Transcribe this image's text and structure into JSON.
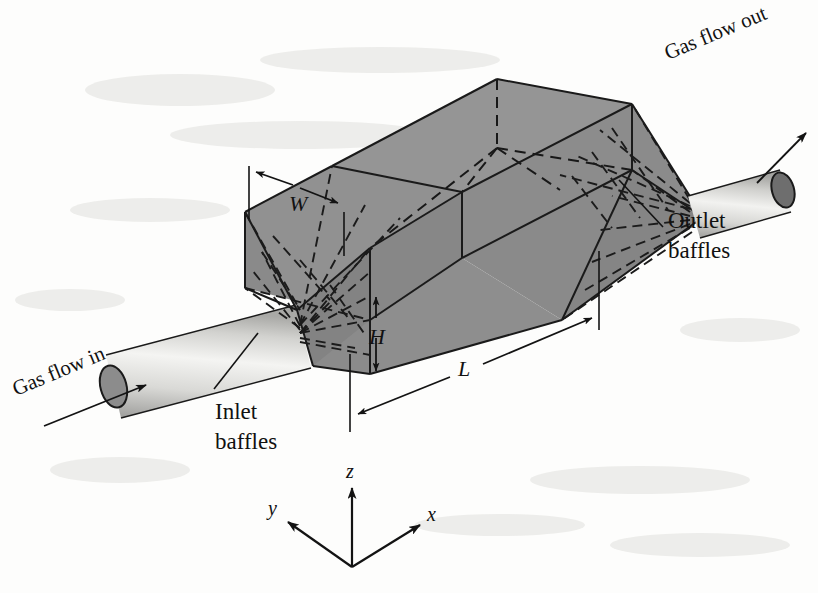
{
  "figure": {
    "background_color": "#fdfdfc",
    "body_fill_top": "#8f8f8f",
    "body_fill_front": "#898989",
    "body_fill_cone": "#868686",
    "pipe_fill_light": "#e8e8e6",
    "pipe_cap_fill": "#8c8c8c",
    "line_color": "#1a1a1a"
  },
  "labels": {
    "gas_flow_in": "Gas flow in",
    "gas_flow_out": "Gas flow out",
    "inlet_baffles_line1": "Inlet",
    "inlet_baffles_line2": "baffles",
    "outlet_baffles_line1": "Outlet",
    "outlet_baffles_line2": "baffles"
  },
  "dimensions": {
    "width": "W",
    "height": "H",
    "length": "L"
  },
  "axes": {
    "x": "x",
    "y": "y",
    "z": "z"
  }
}
